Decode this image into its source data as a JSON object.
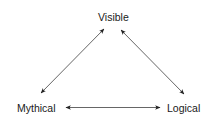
{
  "diagram": {
    "type": "triangle-relationship",
    "nodes": [
      {
        "id": "visible",
        "label": "Visible",
        "position": "top"
      },
      {
        "id": "mythical",
        "label": "Mythical",
        "position": "bottom-left"
      },
      {
        "id": "logical",
        "label": "Logical",
        "position": "bottom-right"
      }
    ],
    "edges": [
      {
        "from": "visible",
        "to": "mythical",
        "style": "bidirectional-arrow"
      },
      {
        "from": "visible",
        "to": "logical",
        "style": "bidirectional-arrow"
      },
      {
        "from": "mythical",
        "to": "logical",
        "style": "bidirectional-arrow"
      }
    ],
    "colors": {
      "line": "#555555",
      "arrowhead": "#222222",
      "text": "#1a1a1a",
      "background": "#ffffff"
    }
  }
}
